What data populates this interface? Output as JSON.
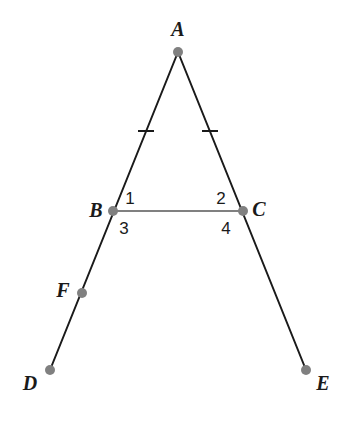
{
  "figure": {
    "width": 347,
    "height": 422,
    "background_color": "#ffffff",
    "stroke_color": "#1a1a1a",
    "accent_color": "#808080",
    "label_color": "#1a1a1a"
  },
  "points": [
    {
      "id": "A",
      "label": "A",
      "x": 178,
      "y": 52,
      "label_x": 178,
      "label_y": 29,
      "dot": true
    },
    {
      "id": "B",
      "label": "B",
      "x": 113,
      "y": 211,
      "label_x": 96,
      "label_y": 210,
      "dot": true
    },
    {
      "id": "C",
      "label": "C",
      "x": 243,
      "y": 211,
      "label_x": 259,
      "label_y": 209,
      "dot": true
    },
    {
      "id": "D",
      "label": "D",
      "x": 50,
      "y": 370,
      "label_x": 30,
      "label_y": 383,
      "dot": true
    },
    {
      "id": "E",
      "label": "E",
      "x": 306,
      "y": 370,
      "label_x": 323,
      "label_y": 383,
      "dot": true
    },
    {
      "id": "F",
      "label": "F",
      "x": 82,
      "y": 293,
      "label_x": 63,
      "label_y": 290,
      "dot": true
    }
  ],
  "segments": [
    {
      "id": "AD",
      "from": "A",
      "to": "D",
      "color": "#1a1a1a",
      "width": 2,
      "description": "line from apex A through B and F down to D"
    },
    {
      "id": "AE",
      "from": "A",
      "to": "E",
      "color": "#1a1a1a",
      "width": 2,
      "description": "line from apex A through C down to E"
    },
    {
      "id": "BC",
      "from": "B",
      "to": "C",
      "color": "#808080",
      "width": 2,
      "description": "gray base segment joining B and C"
    }
  ],
  "tick_marks": [
    {
      "id": "tick-AB",
      "on_segment": "AB",
      "x": 146,
      "y": 131,
      "length": 16,
      "description": "single congruence tick on side AB"
    },
    {
      "id": "tick-AC",
      "on_segment": "AC",
      "x": 210,
      "y": 131,
      "length": 16,
      "description": "single congruence tick on side AC"
    }
  ],
  "angle_labels": [
    {
      "id": "angle-1",
      "label": "1",
      "x": 130,
      "y": 198,
      "description": "angle above segment BC at vertex B, interior"
    },
    {
      "id": "angle-2",
      "label": "2",
      "x": 221,
      "y": 198,
      "description": "angle above segment BC at vertex C, interior"
    },
    {
      "id": "angle-3",
      "label": "3",
      "x": 124,
      "y": 228,
      "description": "angle below segment BC at vertex B, exterior"
    },
    {
      "id": "angle-4",
      "label": "4",
      "x": 226,
      "y": 228,
      "description": "angle below segment BC at vertex C, exterior"
    }
  ],
  "dot_style": {
    "radius": 5,
    "fill": "#808080"
  }
}
